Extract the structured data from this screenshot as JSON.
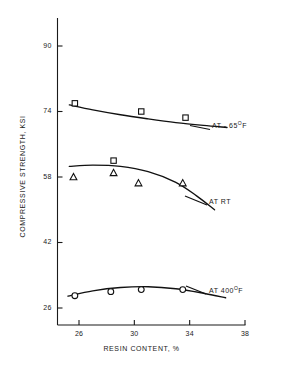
{
  "chart_data": {
    "type": "scatter",
    "title": "",
    "xlabel": "RESIN CONTENT, %",
    "ylabel": "COMPRESSIVE  STRENGTH, KSI",
    "xlim": [
      24.3,
      38.7
    ],
    "ylim": [
      24.0,
      95.0
    ],
    "xticks": [
      26,
      30,
      34,
      38
    ],
    "xtick_labels": [
      "26",
      "30",
      "34",
      "38"
    ],
    "yticks": [
      26,
      42,
      58,
      74,
      90
    ],
    "ytick_labels": [
      "26",
      "42",
      "58",
      "74",
      "90"
    ],
    "grid": false,
    "legend_position": "inline-right",
    "series": [
      {
        "name": "AT - 65°F",
        "label_text": "AT - 65",
        "label_sup": "O",
        "label_suffix": "F",
        "marker": "square",
        "x": [
          25.7,
          30.5,
          33.7
        ],
        "y": [
          76.0,
          74.0,
          72.5
        ],
        "fit_curve_x": [
          25.3,
          27.0,
          29.0,
          31.0,
          33.0,
          35.0,
          36.7
        ],
        "fit_curve_y": [
          75.6,
          74.4,
          73.2,
          72.2,
          71.3,
          70.6,
          70.1
        ]
      },
      {
        "name": "AT RT",
        "label_text": "AT RT",
        "label_sup": "",
        "label_suffix": "",
        "marker": "triangle",
        "x": [
          25.6,
          28.5,
          30.3,
          33.5
        ],
        "y": [
          58.0,
          59.0,
          56.5,
          56.5
        ],
        "extra_marker": "square",
        "extra_x": [
          28.5
        ],
        "extra_y": [
          62.0
        ],
        "fit_curve_x": [
          25.3,
          27.0,
          29.0,
          31.0,
          33.0,
          34.5,
          35.8
        ],
        "fit_curve_y": [
          60.6,
          60.9,
          60.6,
          59.3,
          56.7,
          53.4,
          50.0
        ]
      },
      {
        "name": "AT 400°F",
        "label_text": "AT 400",
        "label_sup": "O",
        "label_suffix": "F",
        "marker": "circle",
        "x": [
          25.7,
          28.3,
          30.5,
          33.5
        ],
        "y": [
          29.0,
          30.0,
          30.5,
          30.5
        ],
        "fit_curve_x": [
          25.2,
          27.0,
          29.0,
          31.0,
          33.0,
          35.0,
          36.6
        ],
        "fit_curve_y": [
          28.9,
          30.2,
          31.0,
          31.2,
          30.7,
          29.6,
          28.5
        ]
      }
    ],
    "colors": {
      "axis": "#1a1a1a",
      "curve": "#111111",
      "marker_stroke": "#111111",
      "marker_fill": "#ffffff",
      "background": "#ffffff"
    }
  }
}
